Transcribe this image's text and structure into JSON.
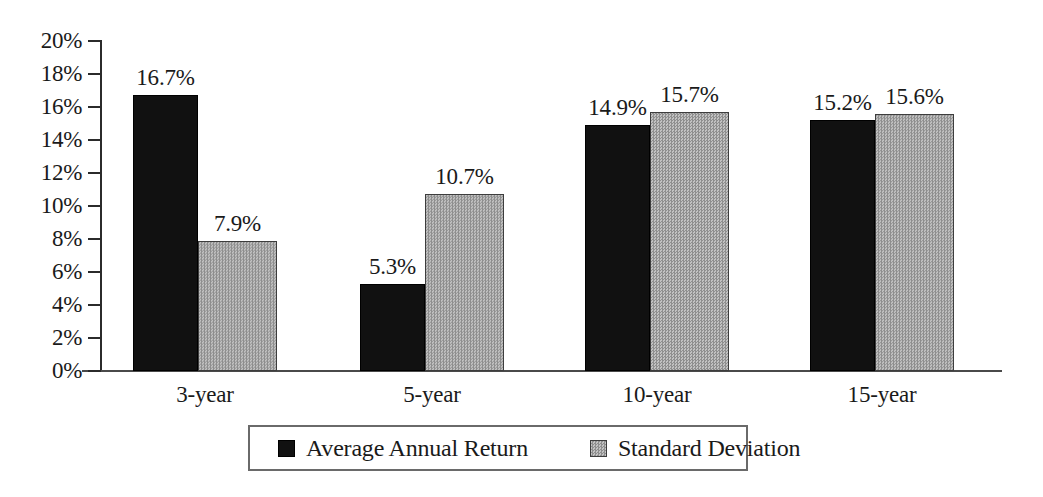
{
  "chart_data": {
    "type": "bar",
    "title": "",
    "subtitle": "",
    "xlabel": "",
    "ylabel": "",
    "categories": [
      "3-year",
      "5-year",
      "10-year",
      "15-year"
    ],
    "series": [
      {
        "name": "Average Annual Return",
        "color": "#111111",
        "values": [
          16.7,
          5.3,
          14.9,
          15.2
        ],
        "labels": [
          "16.7%",
          "5.3%",
          "14.9%",
          "15.2%"
        ]
      },
      {
        "name": "Standard Deviation",
        "color": "#a8a8a8",
        "values": [
          7.9,
          10.7,
          15.7,
          15.6
        ],
        "labels": [
          "7.9%",
          "10.7%",
          "15.7%",
          "15.6%"
        ]
      }
    ],
    "ylim": [
      0,
      20
    ],
    "ytick_values": [
      0,
      2,
      4,
      6,
      8,
      10,
      12,
      14,
      16,
      18,
      20
    ],
    "ytick_labels": [
      "0%",
      "2%",
      "4%",
      "6%",
      "8%",
      "10%",
      "12%",
      "14%",
      "16%",
      "18%",
      "20%"
    ],
    "grid": false,
    "legend_position": "bottom",
    "value_labels": true,
    "units": "percent"
  }
}
